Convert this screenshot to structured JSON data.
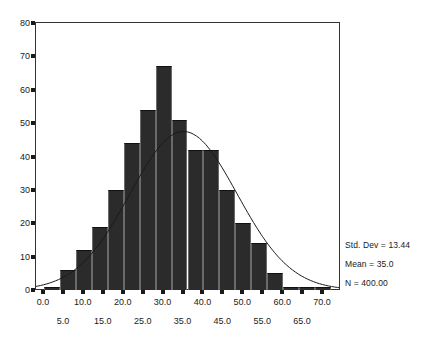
{
  "chart_data": {
    "type": "bar",
    "title": "",
    "subtitle": "",
    "xlabel": "",
    "ylabel": "",
    "xlim": [
      -2,
      74
    ],
    "ylim": [
      0,
      80
    ],
    "grid": false,
    "legend_position": "right",
    "bin_width": 4,
    "categories": [
      "0",
      "4",
      "8",
      "12",
      "16",
      "20",
      "24",
      "28",
      "32",
      "36",
      "40",
      "44",
      "48",
      "52",
      "56",
      "60",
      "64",
      "68"
    ],
    "bin_starts": [
      0,
      4,
      8,
      12,
      16,
      20,
      24,
      28,
      32,
      36,
      40,
      44,
      48,
      52,
      56,
      60,
      64,
      68
    ],
    "values": [
      1,
      6,
      12,
      19,
      30,
      44,
      54,
      67,
      51,
      42,
      42,
      30,
      20,
      14,
      5,
      1,
      1,
      1
    ],
    "series": [
      {
        "name": "Frequency",
        "values": [
          1,
          6,
          12,
          19,
          30,
          44,
          54,
          67,
          51,
          42,
          42,
          30,
          20,
          14,
          5,
          1,
          1,
          1
        ]
      }
    ],
    "overlay": {
      "type": "line",
      "name": "Normal curve",
      "mean": 35.0,
      "std_dev": 13.44,
      "n": 400,
      "peak_value": 59
    },
    "yticks": [
      0,
      10,
      20,
      30,
      40,
      50,
      60,
      70,
      80
    ],
    "ytick_labels": [
      "0",
      "10",
      "20",
      "30",
      "40",
      "50",
      "60",
      "70",
      "80"
    ],
    "xticks": [
      0,
      5,
      10,
      15,
      20,
      25,
      30,
      35,
      40,
      45,
      50,
      55,
      60,
      65,
      70
    ],
    "xtick_labels_top": [
      {
        "value": 0,
        "label": "0.0"
      },
      {
        "value": 10,
        "label": "10.0"
      },
      {
        "value": 20,
        "label": "20.0"
      },
      {
        "value": 30,
        "label": "30.0"
      },
      {
        "value": 40,
        "label": "40.0"
      },
      {
        "value": 50,
        "label": "50.0"
      },
      {
        "value": 60,
        "label": "60.0"
      },
      {
        "value": 70,
        "label": "70.0"
      }
    ],
    "xtick_labels_bottom": [
      {
        "value": 5,
        "label": "5.0"
      },
      {
        "value": 15,
        "label": "15.0"
      },
      {
        "value": 25,
        "label": "25.0"
      },
      {
        "value": 35,
        "label": "35.0"
      },
      {
        "value": 45,
        "label": "45.0"
      },
      {
        "value": 55,
        "label": "55.0"
      },
      {
        "value": 65,
        "label": "65.0"
      }
    ],
    "annotations": [
      "Std. Dev = 13.44",
      "Mean = 35.0",
      "N = 400.00"
    ]
  },
  "stats": {
    "std_dev": "Std. Dev = 13.44",
    "mean": "Mean = 35.0",
    "n": "N = 400.00"
  },
  "colors": {
    "bar_fill": "#2b2b2b",
    "bar_edge": "#6a6a6a",
    "axis": "#333333",
    "curve": "#1a1a1a",
    "background": "#ffffff",
    "text": "#1a1a1a"
  }
}
